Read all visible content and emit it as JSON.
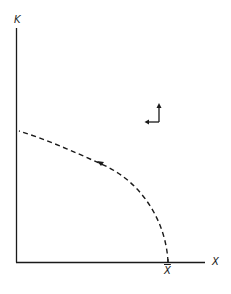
{
  "diagram": {
    "type": "phase-diagram",
    "axes": {
      "y_label": "K",
      "x_label": "X",
      "x_marker_label": "X̄"
    },
    "curve": {
      "style": "dashed",
      "description": "trajectory from X̄ on x-axis curving up-left to K-axis",
      "direction": "up-left"
    },
    "direction_arrows": {
      "description": "vector field arrows pointing up and left"
    },
    "colors": {
      "ink": "#1a1a1a",
      "background": "#ffffff"
    }
  }
}
